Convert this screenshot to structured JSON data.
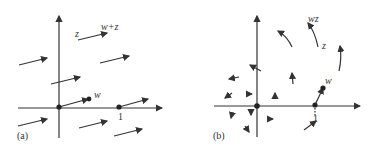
{
  "panels": [
    {
      "id": "a",
      "caption": "(a)",
      "labels": {
        "z": "z",
        "w_plus_z": "w+z",
        "w": "w",
        "one": "1"
      }
    },
    {
      "id": "b",
      "caption": "(b)",
      "labels": {
        "wz": "wz",
        "z": "z",
        "w": "w",
        "one": "1"
      }
    }
  ],
  "colors": {
    "ink": "#333333",
    "background": "#ffffff"
  }
}
